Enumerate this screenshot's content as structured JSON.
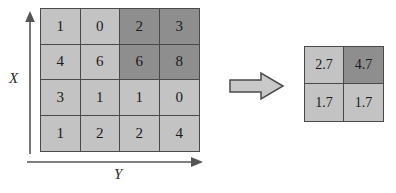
{
  "diagram": {
    "background_color": "#ffffff",
    "axes": {
      "x_label": "X",
      "y_label": "Y",
      "x_arrow_name": "vertical-axis-arrow",
      "y_arrow_name": "horizontal-axis-arrow"
    },
    "transform_arrow": {
      "icon": "block-arrow-right-icon",
      "direction": "right"
    },
    "colors": {
      "cell_light": "#c3c3c3",
      "cell_dark": "#8e8e8e",
      "grid_line": "#4a4a4a",
      "text": "#1a1a1a"
    }
  },
  "chart_data": {
    "type": "heatmap",
    "xlabel": "Y",
    "ylabel": "X",
    "grid": true,
    "legend": "none",
    "input_matrix": {
      "name": "input-matrix",
      "rows": 4,
      "cols": 4,
      "values": [
        [
          1,
          0,
          2,
          3
        ],
        [
          4,
          6,
          6,
          8
        ],
        [
          3,
          1,
          1,
          0
        ],
        [
          1,
          2,
          2,
          4
        ]
      ],
      "shades": [
        [
          "light",
          "light",
          "dark",
          "dark"
        ],
        [
          "light",
          "light",
          "dark",
          "dark"
        ],
        [
          "light",
          "light",
          "light",
          "light"
        ],
        [
          "light",
          "light",
          "light",
          "light"
        ]
      ]
    },
    "output_matrix": {
      "name": "output-matrix",
      "rows": 2,
      "cols": 2,
      "values": [
        [
          2.7,
          4.7
        ],
        [
          1.7,
          1.7
        ]
      ],
      "shades": [
        [
          "light",
          "dark"
        ],
        [
          "light",
          "light"
        ]
      ]
    }
  }
}
